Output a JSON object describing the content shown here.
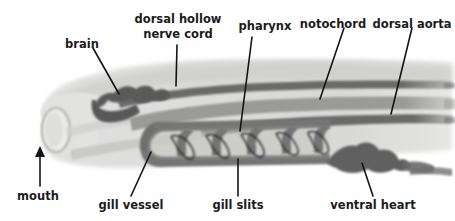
{
  "figure": {
    "background_color": "#ffffff",
    "label_color": "#1b1b1b",
    "leader_line_color": "#141414",
    "body_fill": "#d8d8d6",
    "body_fill_light": "#e6e6e4",
    "organ_dark": "#6e6e6e",
    "organ_mid": "#8c8c8c",
    "organ_darkest": "#4f4f4f"
  },
  "labels": [
    {
      "id": "brain",
      "text": "brain",
      "x": 82,
      "y": 38
    },
    {
      "id": "dorsal-hollow-l1",
      "text": "dorsal hollow",
      "x": 178,
      "y": 13
    },
    {
      "id": "dorsal-hollow-l2",
      "text": "nerve cord",
      "x": 178,
      "y": 28
    },
    {
      "id": "pharynx",
      "text": "pharynx",
      "x": 265,
      "y": 20
    },
    {
      "id": "notochord",
      "text": "notochord",
      "x": 333,
      "y": 18
    },
    {
      "id": "dorsal-aorta",
      "text": "dorsal aorta",
      "x": 412,
      "y": 18
    },
    {
      "id": "mouth",
      "text": "mouth",
      "x": 38,
      "y": 196
    },
    {
      "id": "gill-vessel",
      "text": "gill vessel",
      "x": 131,
      "y": 208
    },
    {
      "id": "gill-slits",
      "text": "gill slits",
      "x": 238,
      "y": 208
    },
    {
      "id": "ventral-heart",
      "text": "ventral heart",
      "x": 373,
      "y": 208
    }
  ],
  "leader_lines": [
    {
      "id": "brain-leader",
      "x1": 93,
      "y1": 48,
      "x2": 119,
      "y2": 94
    },
    {
      "id": "nerve-cord-leader",
      "x1": 177,
      "y1": 45,
      "x2": 176,
      "y2": 86
    },
    {
      "id": "pharynx-leader",
      "x1": 252,
      "y1": 37,
      "x2": 240,
      "y2": 131
    },
    {
      "id": "notochord-leader",
      "x1": 344,
      "y1": 28,
      "x2": 320,
      "y2": 99
    },
    {
      "id": "dorsal-aorta-leader",
      "x1": 412,
      "y1": 28,
      "x2": 391,
      "y2": 114
    },
    {
      "id": "mouth-leader",
      "x1": 40,
      "y1": 186,
      "x2": 40,
      "y2": 150
    },
    {
      "id": "gill-vessel-leader",
      "x1": 131,
      "y1": 196,
      "x2": 151,
      "y2": 152
    },
    {
      "id": "gill-slits-leader",
      "x1": 238,
      "y1": 196,
      "x2": 238,
      "y2": 159
    },
    {
      "id": "ventral-heart-leader",
      "x1": 373,
      "y1": 196,
      "x2": 362,
      "y2": 163
    }
  ],
  "structures": {
    "body": "lancelet body silhouette, translucent gray wash, rounded snout at left",
    "mouth": "oval opening at anterior tip",
    "brain": "lumpy dark swelling at anterior end of nerve cord",
    "nerve_cord": "dark dorsal stripe running full length above notochord",
    "notochord": "mid-gray stripe beneath nerve cord",
    "dorsal_aorta": "dark stripe below notochord",
    "pharynx": "large basket-shaped chamber behind mouth",
    "gill_vessel": "dark U-shaped vessel outlining the pharyngeal basket",
    "gill_bars_count": 5,
    "gill_slits_count": 5,
    "ventral_heart": "dark irregular bulbous mass at ventral posterior of pharynx"
  }
}
